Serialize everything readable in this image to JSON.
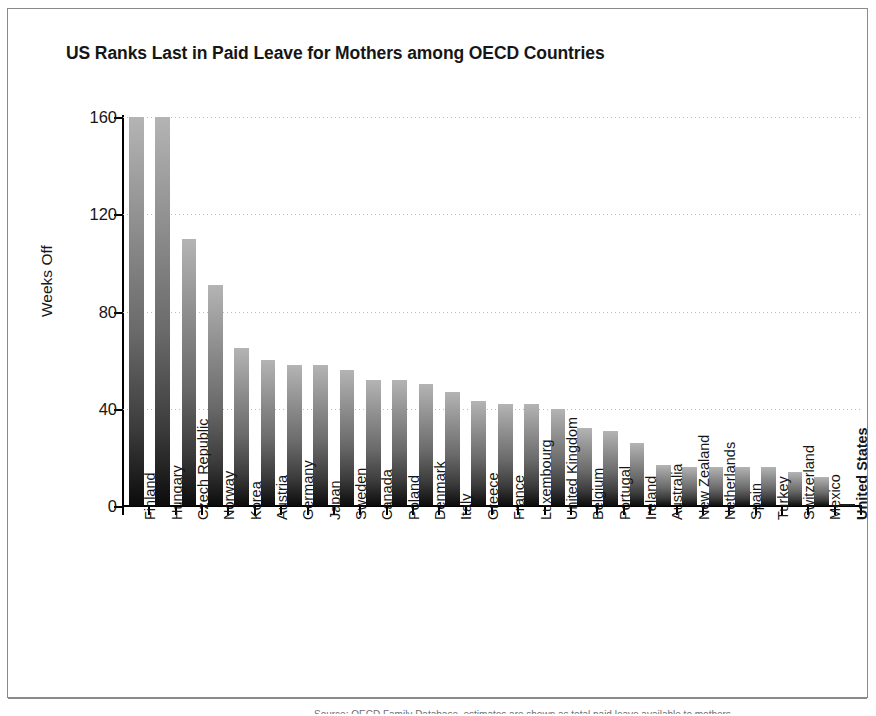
{
  "figure": {
    "title": "US Ranks Last in Paid Leave for Mothers among OECD Countries",
    "source_note": "Source: OECD Family Database, estimates  are  shown  as  total  paid  leave  available  to  mothers"
  },
  "chart_data": {
    "type": "bar",
    "title": "US Ranks Last in Paid Leave for Mothers among OECD Countries",
    "xlabel": "",
    "ylabel": "Weeks Off",
    "ylim": [
      0,
      160
    ],
    "yticks": [
      0,
      40,
      80,
      120,
      160
    ],
    "grid": true,
    "legend": "none",
    "orientation": "vertical",
    "highlighted_category": "United States",
    "categories": [
      "Finland",
      "Hungary",
      "Czech Republic",
      "Norway",
      "Korea",
      "Austria",
      "Germany",
      "Japan",
      "Sweden",
      "Canada",
      "Poland",
      "Denmark",
      "Italy",
      "Greece",
      "France",
      "Luxembourg",
      "United Kingdom",
      "Belgium",
      "Portugal",
      "Ireland",
      "Australia",
      "New Zealand",
      "Netherlands",
      "Spain",
      "Turkey",
      "Switzerland",
      "Mexico",
      "United States"
    ],
    "values": [
      161,
      161,
      110,
      91,
      65,
      60,
      58,
      58,
      56,
      52,
      52,
      50,
      47,
      43,
      42,
      42,
      40,
      32,
      31,
      26,
      17,
      16,
      16,
      16,
      16,
      14,
      12,
      0.5
    ]
  }
}
